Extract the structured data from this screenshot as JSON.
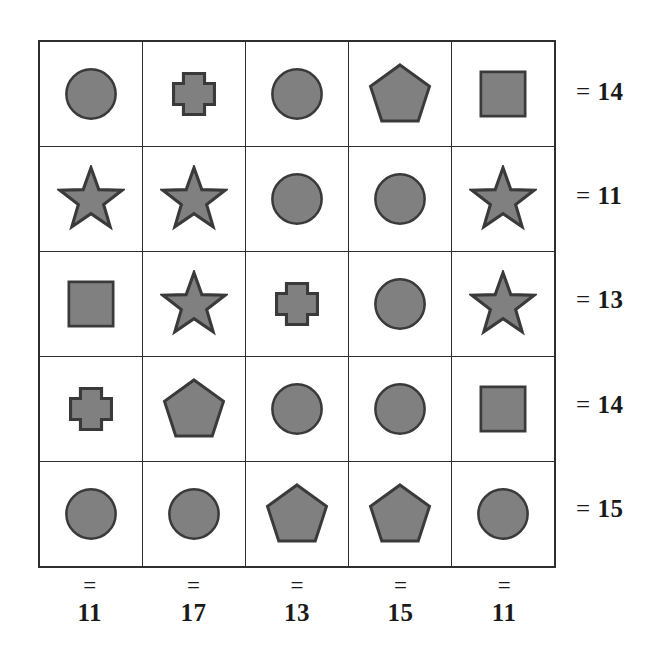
{
  "puzzle": {
    "title": "Shape Sum Grid Puzzle",
    "rows": 5,
    "columns": 5,
    "shape_fill_color": "#808080",
    "shape_stroke_color": "#3a3a3a",
    "grid_line_color": "#2e2e2e",
    "background_color": "#ffffff",
    "equals_sign": "=",
    "grid": [
      [
        "circle",
        "cross",
        "circle",
        "pentagon",
        "square"
      ],
      [
        "star",
        "star",
        "circle",
        "circle",
        "star"
      ],
      [
        "square",
        "star",
        "cross",
        "circle",
        "star"
      ],
      [
        "cross",
        "pentagon",
        "circle",
        "circle",
        "square"
      ],
      [
        "circle",
        "circle",
        "pentagon",
        "pentagon",
        "circle"
      ]
    ],
    "row_sums": [
      "14",
      "11",
      "13",
      "14",
      "15"
    ],
    "column_sums": [
      "11",
      "17",
      "13",
      "15",
      "11"
    ]
  },
  "chart_data": {
    "type": "table",
    "categories": [
      "col1",
      "col2",
      "col3",
      "col4",
      "col5"
    ],
    "rows": [
      {
        "cells": [
          "circle",
          "cross",
          "circle",
          "pentagon",
          "square"
        ],
        "sum": 14
      },
      {
        "cells": [
          "star",
          "star",
          "circle",
          "circle",
          "star"
        ],
        "sum": 11
      },
      {
        "cells": [
          "square",
          "star",
          "cross",
          "circle",
          "star"
        ],
        "sum": 13
      },
      {
        "cells": [
          "cross",
          "pentagon",
          "circle",
          "circle",
          "square"
        ],
        "sum": 14
      },
      {
        "cells": [
          "circle",
          "circle",
          "pentagon",
          "pentagon",
          "circle"
        ],
        "sum": 15
      }
    ],
    "row_sums": [
      14,
      11,
      13,
      14,
      15
    ],
    "column_sums": [
      11,
      17,
      13,
      15,
      11
    ],
    "grid": true,
    "legend": "none"
  }
}
